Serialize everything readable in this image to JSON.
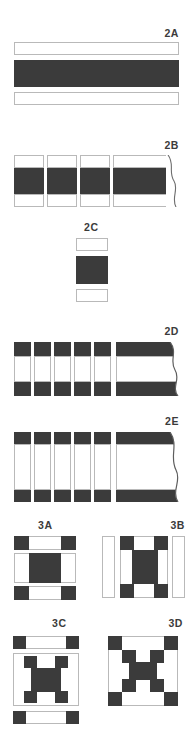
{
  "figure": {
    "title": "",
    "background_color": "#ffffff",
    "dark_color": "#3b3b3b",
    "light_color": "#ffffff",
    "outline_color": "#b9b9b9",
    "width_px": 193,
    "height_px": 733
  },
  "panels": [
    {
      "id": "2A",
      "label": "2A",
      "description": "Three stacked full-width horizontal bands: thin outlined light band, thick dark band, thin outlined light band.",
      "rows": [
        {
          "type": "light",
          "height_px": 12
        },
        {
          "type": "dark",
          "height_px": 26
        },
        {
          "type": "light",
          "height_px": 12
        }
      ]
    },
    {
      "id": "2B",
      "label": "2B",
      "description": "Four columns (three narrow, one wide with torn right edge); each column has light top, dark middle, light bottom.",
      "columns": [
        {
          "width_px": 28,
          "torn": false
        },
        {
          "width_px": 28,
          "torn": false
        },
        {
          "width_px": 28,
          "torn": false
        },
        {
          "width_px": 66,
          "torn": true
        }
      ],
      "rows": [
        {
          "type": "light",
          "height_px": 14
        },
        {
          "type": "dark",
          "height_px": 32
        },
        {
          "type": "light",
          "height_px": 14
        }
      ]
    },
    {
      "id": "2C",
      "label": "2C",
      "description": "Single narrow column: small outlined light block, dark square, small outlined light block.",
      "rows": [
        {
          "type": "light",
          "height_px": 12
        },
        {
          "type": "dark",
          "height_px": 26
        },
        {
          "type": "light",
          "height_px": 12
        }
      ],
      "column_width_px": 30
    },
    {
      "id": "2D",
      "label": "2D",
      "description": "Five narrow vertical strips plus one wide strip with torn right edge; each strip has a dark cap top and bottom with a light centre.",
      "strips": [
        {
          "width_px": 16,
          "torn": false
        },
        {
          "width_px": 16,
          "torn": false
        },
        {
          "width_px": 16,
          "torn": false
        },
        {
          "width_px": 16,
          "torn": false
        },
        {
          "width_px": 16,
          "torn": false
        },
        {
          "width_px": 76,
          "torn": true
        }
      ],
      "rows": [
        {
          "type": "dark",
          "height_px": 13
        },
        {
          "type": "light",
          "height_px": 26
        },
        {
          "type": "dark",
          "height_px": 13
        }
      ]
    },
    {
      "id": "2E",
      "label": "2E",
      "description": "Same as 2D but with a taller light centre section.",
      "strips": [
        {
          "width_px": 16,
          "torn": false
        },
        {
          "width_px": 16,
          "torn": false
        },
        {
          "width_px": 16,
          "torn": false
        },
        {
          "width_px": 16,
          "torn": false
        },
        {
          "width_px": 16,
          "torn": false
        },
        {
          "width_px": 76,
          "torn": true
        }
      ],
      "rows": [
        {
          "type": "dark",
          "height_px": 11
        },
        {
          "type": "light",
          "height_px": 48
        },
        {
          "type": "dark",
          "height_px": 11
        }
      ]
    },
    {
      "id": "3A",
      "label": "3A",
      "description": "Three stacked bands. Top and bottom bands: dark square, light gap, dark square. Middle band: light, dark square, light.",
      "grid": [
        [
          "dark",
          "light",
          "dark"
        ],
        [
          "light",
          "dark",
          "light"
        ],
        [
          "dark",
          "light",
          "dark"
        ]
      ],
      "separated_bands": true
    },
    {
      "id": "3B",
      "label": "3B",
      "description": "Central 3x3 checker block flanked left and right by tall outlined light bars.",
      "grid": [
        [
          "dark",
          "light",
          "dark"
        ],
        [
          "light",
          "dark",
          "light"
        ],
        [
          "dark",
          "light",
          "dark"
        ]
      ],
      "side_bars": 2
    },
    {
      "id": "3C",
      "label": "3C",
      "description": "Top horizontal bar (dark-light-dark), central framed 3x3 checker block, bottom horizontal bar (dark-light-dark).",
      "grid": [
        [
          "dark",
          "light",
          "dark"
        ],
        [
          "light",
          "dark",
          "light"
        ],
        [
          "dark",
          "light",
          "dark"
        ]
      ],
      "top_bar": true,
      "bottom_bar": true
    },
    {
      "id": "3D",
      "label": "3D",
      "description": "Five-by-five arrangement: outer corners dark, inner corners dark, central dark square, remainder light.",
      "grid": [
        [
          "dark",
          "light",
          "light",
          "light",
          "dark"
        ],
        [
          "light",
          "dark",
          "light",
          "dark",
          "light"
        ],
        [
          "light",
          "light",
          "dark",
          "light",
          "light"
        ],
        [
          "light",
          "dark",
          "light",
          "dark",
          "light"
        ],
        [
          "dark",
          "light",
          "light",
          "light",
          "dark"
        ]
      ]
    }
  ]
}
